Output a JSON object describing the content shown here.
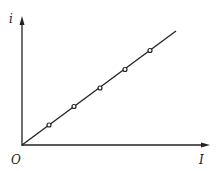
{
  "diagram": {
    "y_axis_label": "i",
    "x_axis_label": "I",
    "origin_label": "O",
    "line_color": "#222222",
    "points": [
      [
        49,
        125
      ],
      [
        74,
        106
      ],
      [
        100,
        88
      ],
      [
        125,
        70
      ],
      [
        151,
        50
      ]
    ]
  }
}
